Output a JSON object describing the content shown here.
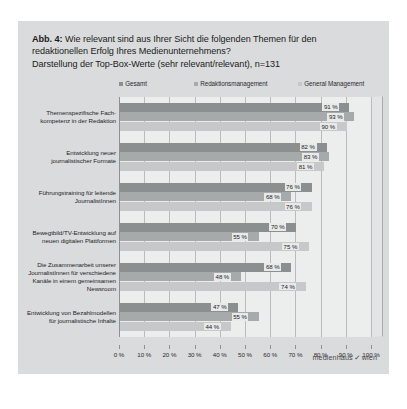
{
  "figure": {
    "title_label": "Abb. 4:",
    "title_line_1": "Wie relevant sind aus Ihrer Sicht die folgenden Themen für den",
    "title_line_2": "redaktionellen Erfolg Ihres Medienunternehmens?",
    "title_line_3": "Darstellung der Top-Box-Werte (sehr relevant/relevant), n=131",
    "brand_left": "medienhaus",
    "brand_check": "✓",
    "brand_right": "wien",
    "panel_color": "#d9dbdc",
    "plot_color": "#eceded"
  },
  "chart_data": {
    "type": "bar",
    "orientation": "horizontal",
    "title": "Abb. 4: Wie relevant sind aus Ihrer Sicht die folgenden Themen für den redaktionellen Erfolg Ihres Medienunternehmens? Darstellung der Top-Box-Werte (sehr relevant/relevant), n=131",
    "xlabel": "",
    "ylabel": "",
    "xlim": [
      0,
      100
    ],
    "grid": true,
    "legend_position": "top",
    "n": 131,
    "unit": "%",
    "categories": [
      "Themenspezifische Fach-\nkompetenz in der Redaktion",
      "Entwicklung neuer\njournalistischer Formate",
      "Führungstraining für leitende\nJournalistInnen",
      "Bewegtbild/TV-Entwicklung auf\nneuen digitalen Plattformen",
      "Die Zusammenarbeit unserer\nJournalistInnen für verschiedene\nKanäle in einem gemeinsamen\nNewsroom",
      "Entwicklung von Bezahlmodellen\nfür journalistische Inhalte"
    ],
    "series": [
      {
        "name": "Gesamt",
        "color": "#8c8f90",
        "values": [
          91,
          82,
          76,
          70,
          68,
          47
        ]
      },
      {
        "name": "Redaktionsmanagement",
        "color": "#a7aaab",
        "values": [
          93,
          83,
          68,
          55,
          48,
          55
        ]
      },
      {
        "name": "General Management",
        "color": "#c6c8c9",
        "values": [
          90,
          81,
          76,
          75,
          74,
          44
        ]
      }
    ],
    "value_labels": [
      [
        "91 %",
        "93 %",
        "90 %"
      ],
      [
        "82 %",
        "83 %",
        "81 %"
      ],
      [
        "76 %",
        "68 %",
        "76 %"
      ],
      [
        "70 %",
        "55 %",
        "75 %"
      ],
      [
        "68 %",
        "48 %",
        "74 %"
      ],
      [
        "47 %",
        "55 %",
        "44 %"
      ]
    ],
    "xticks": [
      0,
      10,
      20,
      30,
      40,
      50,
      60,
      70,
      80,
      90,
      100
    ],
    "xtick_labels": [
      "0 %",
      "10 %",
      "20 %",
      "30 %",
      "40 %",
      "50 %",
      "60 %",
      "70 %",
      "80 %",
      "90 %",
      "100 %"
    ]
  }
}
